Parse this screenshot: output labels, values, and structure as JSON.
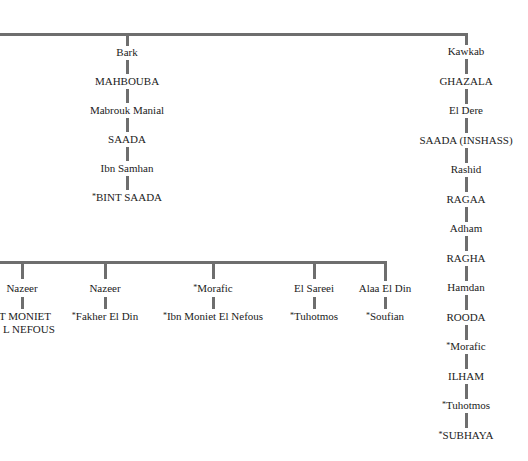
{
  "top_branches": {
    "middle_column": [
      {
        "name": "Bark",
        "star": false
      },
      {
        "name": "MAHBOUBA",
        "star": false
      },
      {
        "name": "Mabrouk Manial",
        "star": false
      },
      {
        "name": "SAADA",
        "star": false
      },
      {
        "name": "Ibn Samhan",
        "star": false
      },
      {
        "name": "BINT SAADA",
        "star": true
      }
    ],
    "right_column": [
      {
        "name": "Kawkab",
        "star": false
      },
      {
        "name": "GHAZALA",
        "star": false
      },
      {
        "name": "El Dere",
        "star": false
      },
      {
        "name": "SAADA (INSHASS)",
        "star": false
      },
      {
        "name": "Rashid",
        "star": false
      },
      {
        "name": "RAGAA",
        "star": false
      },
      {
        "name": "Adham",
        "star": false
      },
      {
        "name": "RAGHA",
        "star": false
      },
      {
        "name": "Hamdan",
        "star": false
      },
      {
        "name": "ROODA",
        "star": false
      },
      {
        "name": "Morafic",
        "star": true
      },
      {
        "name": "ILHAM",
        "star": false
      },
      {
        "name": "Tuhotmos",
        "star": true
      },
      {
        "name": "SUBHAYA",
        "star": true
      }
    ]
  },
  "lower_branches": [
    {
      "sire": "Nazeer",
      "sire_star": false,
      "offspring": "NT MONIET",
      "offspring_line2": "L NEFOUS",
      "offspring_star": false
    },
    {
      "sire": "Nazeer",
      "sire_star": false,
      "offspring": "Fakher El Din",
      "offspring_star": true
    },
    {
      "sire": "Morafic",
      "sire_star": true,
      "offspring": "Ibn Moniet El Nefous",
      "offspring_star": true
    },
    {
      "sire": "El Sareei",
      "sire_star": false,
      "offspring": "Tuhotmos",
      "offspring_star": true
    },
    {
      "sire": "Alaa El Din",
      "sire_star": false,
      "offspring": "Soufian",
      "offspring_star": true
    }
  ],
  "star_glyph": "*",
  "line_color": "#6e6e6e"
}
